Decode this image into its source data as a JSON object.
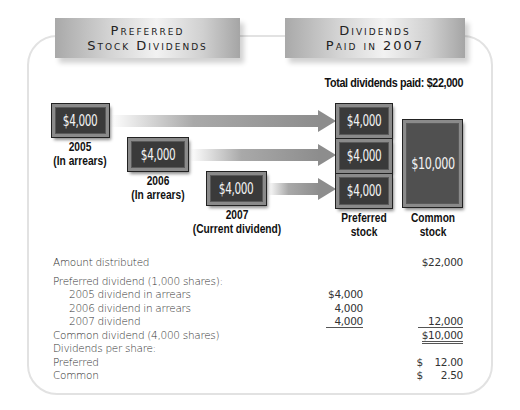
{
  "headers": {
    "left": [
      "Preferred",
      "Stock Dividends"
    ],
    "right": [
      "Dividends",
      "Paid in 2007"
    ]
  },
  "total_label": "Total dividends paid: $22,000",
  "sources": [
    {
      "amount": "$4,000",
      "year": "2005",
      "note": "(In arrears)"
    },
    {
      "amount": "$4,000",
      "year": "2006",
      "note": "(In arrears)"
    },
    {
      "amount": "$4,000",
      "year": "2007",
      "note": "(Current dividend)"
    }
  ],
  "preferred_stack": {
    "amounts": [
      "$4,000",
      "$4,000",
      "$4,000"
    ],
    "caption": [
      "Preferred",
      "stock"
    ]
  },
  "common_box": {
    "amount": "$10,000",
    "caption": [
      "Common",
      "stock"
    ]
  },
  "table": {
    "rows": [
      {
        "label": "Amount distributed",
        "col1": "",
        "col2": "$22,000"
      },
      {
        "label": "Preferred dividend (1,000 shares):",
        "col1": "",
        "col2": ""
      },
      {
        "label": "2005 dividend in arrears",
        "col1": "$4,000",
        "col2": ""
      },
      {
        "label": "2006 dividend in arrears",
        "col1": "4,000",
        "col2": ""
      },
      {
        "label": "2007 dividend",
        "col1": "4,000",
        "col2": "12,000"
      },
      {
        "label": "Common dividend (4,000 shares)",
        "col1": "",
        "col2": "$10,000"
      },
      {
        "label": "Dividends per share:",
        "col1": "",
        "col2": ""
      },
      {
        "label": "Preferred",
        "col1": "",
        "col2_sym": "$",
        "col2": "12.00"
      },
      {
        "label": "Common",
        "col1": "",
        "col2_sym": "$",
        "col2": "2.50"
      }
    ]
  },
  "colors": {
    "money_box": "#3a3a3a",
    "arrow": "#8d8d8d",
    "frame": "#e2e2e2"
  }
}
